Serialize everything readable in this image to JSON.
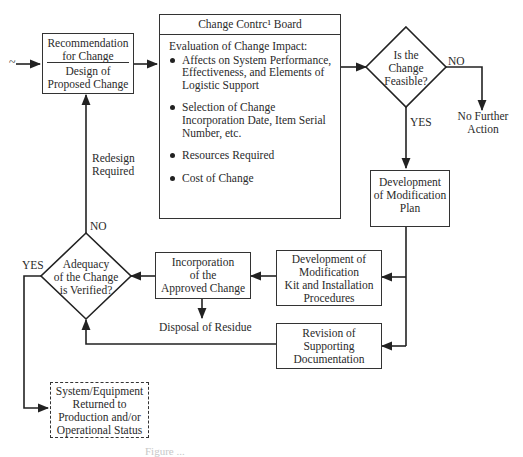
{
  "diagram": {
    "type": "flowchart",
    "entry_marker": "~",
    "nodes": {
      "recommendation": {
        "top": "Recommendation for Change",
        "top_lines": [
          "Recommendation",
          "for Change"
        ],
        "bottom_lines": [
          "Design of",
          "Proposed Change"
        ]
      },
      "ccb": {
        "title": "Change Contrc¹ Board",
        "heading": "Evaluation of Change Impact:",
        "items": [
          {
            "lines": [
              "Affects on System Performance,",
              "Effectiveness, and Elements of",
              "Logistic Support"
            ]
          },
          {
            "lines": [
              "Selection of Change",
              "Incorporation Date, Item Serial",
              "Number, etc."
            ]
          },
          {
            "lines": [
              "Resources Required"
            ]
          },
          {
            "lines": [
              "Cost of Change"
            ]
          }
        ]
      },
      "feasible": {
        "lines": [
          "Is the",
          "Change",
          "Feasible?"
        ]
      },
      "no_further_action": {
        "lines": [
          "No Further",
          "Action"
        ]
      },
      "modification_plan": {
        "lines": [
          "Development",
          "of Modification",
          "Plan"
        ]
      },
      "mod_kit": {
        "lines": [
          "Development of",
          "Modification",
          "Kit and Installation",
          "Procedures"
        ]
      },
      "revision_docs": {
        "lines": [
          "Revision of",
          "Supporting",
          "Documentation"
        ]
      },
      "incorporation": {
        "lines": [
          "Incorporation",
          "of the",
          "Approved Change"
        ]
      },
      "disposal": {
        "label": "Disposal of Residue"
      },
      "adequacy": {
        "lines": [
          "Adequacy",
          "of the Change",
          "is Verified?"
        ]
      },
      "returned": {
        "lines": [
          "System/Equipment",
          "Returned to",
          "Production and/or",
          "Operational Status"
        ]
      }
    },
    "edge_labels": {
      "feasible_no": "NO",
      "feasible_yes": "YES",
      "adequacy_no": "NO",
      "adequacy_yes": "YES",
      "redesign": [
        "Redesign",
        "Required"
      ]
    },
    "caption": "Figure ..."
  }
}
